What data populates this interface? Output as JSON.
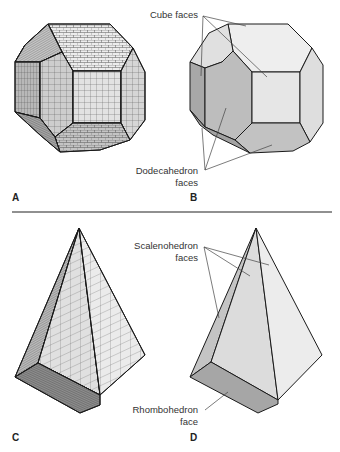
{
  "figure": {
    "panels": [
      {
        "id": "A",
        "label": "A",
        "shape": "truncated-cube-like crystal with grid texture"
      },
      {
        "id": "B",
        "label": "B",
        "shape": "same crystal, shaded faces, annotated"
      },
      {
        "id": "C",
        "label": "C",
        "shape": "scalenohedron with grid texture"
      },
      {
        "id": "D",
        "label": "D",
        "shape": "scalenohedron, shaded faces, annotated"
      }
    ],
    "annotations": {
      "cube_faces": "Cube faces",
      "dodecahedron_line1": "Dodecahedron",
      "dodecahedron_line2": "faces",
      "scalenohedron_line1": "Scalenohedron",
      "scalenohedron_line2": "faces",
      "rhombohedron_line1": "Rhombohedron",
      "rhombohedron_line2": "face"
    },
    "colors": {
      "face_light": "#ececec",
      "face_mid": "#d4d4d4",
      "face_dark": "#b4b4b4",
      "face_darker": "#9c9c9c",
      "edge": "#1a1a1a",
      "leader": "#444444",
      "divider": "#222222"
    }
  }
}
